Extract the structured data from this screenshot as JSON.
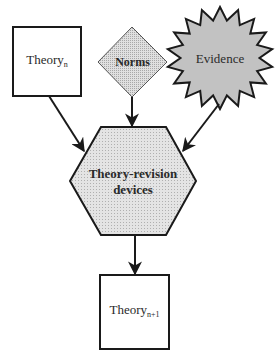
{
  "diagram": {
    "nodes": {
      "theory_n": {
        "label": "Theory",
        "subscript": "n",
        "shape": "square"
      },
      "norms": {
        "label": "Norms",
        "shape": "diamond",
        "fill": "#d8d8d8"
      },
      "evidence": {
        "label": "Evidence",
        "shape": "starburst",
        "fill": "#c4c4c4"
      },
      "devices": {
        "label_line1": "Theory-revision",
        "label_line2": "devices",
        "shape": "hexagon",
        "fill": "#dedede"
      },
      "theory_n1": {
        "label": "Theory",
        "subscript": "n+1",
        "shape": "square"
      }
    },
    "edges": [
      {
        "from": "theory_n",
        "to": "devices"
      },
      {
        "from": "norms",
        "to": "devices"
      },
      {
        "from": "evidence",
        "to": "devices"
      },
      {
        "from": "devices",
        "to": "theory_n1"
      }
    ],
    "colors": {
      "stroke": "#1a1a1a",
      "box_fill": "#ffffff"
    }
  }
}
